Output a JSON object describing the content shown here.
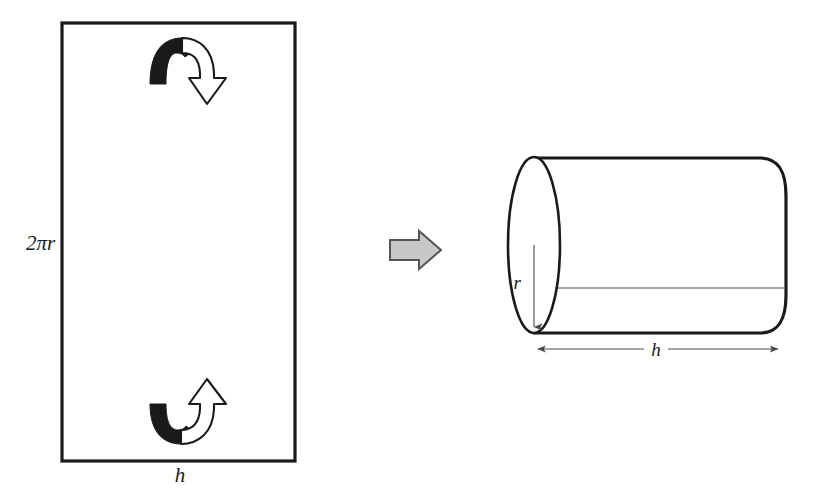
{
  "figure": {
    "background_color": "#ffffff",
    "ink_color": "#1a1a1a",
    "gray_arrow_fill": "#c8c8c8",
    "gray_arrow_stroke": "#555555",
    "thin_line_color": "#4a4a4a"
  },
  "rectangle": {
    "name": "unrolled-lateral-surface",
    "height_label": "2πr",
    "width_label": "h",
    "x": 62,
    "y": 23,
    "width": 233,
    "height": 438
  },
  "roll_arrows": {
    "top": {
      "name": "roll-arrow-top",
      "direction": "down-right",
      "style": "curved-ribbon-with-hollow-head"
    },
    "bottom": {
      "name": "roll-arrow-bottom",
      "direction": "up-right",
      "style": "curved-ribbon-with-hollow-head"
    }
  },
  "transition_arrow": {
    "name": "transformation-arrow",
    "direction": "right",
    "fill": "#c8c8c8",
    "stroke": "#555555"
  },
  "cylinder": {
    "name": "rolled-cylinder",
    "radius_label": "r",
    "length_label": "h",
    "orientation": "horizontal",
    "ellipse_center_x": 534,
    "ellipse_center_y": 245,
    "ellipse_rx": 26,
    "ellipse_ry": 88,
    "body_right_x": 786,
    "top_edge_y": 158,
    "bottom_edge_y": 333,
    "seam_y": 288
  },
  "dimension_lines": {
    "cylinder_length": {
      "name": "h-dimension-arrow",
      "label": "h",
      "x_start": 534,
      "x_end": 780,
      "y": 349,
      "heads": "both"
    },
    "cylinder_radius": {
      "name": "r-dimension-arrow",
      "label": "r",
      "x": 534,
      "y_start": 245,
      "y_end": 331,
      "heads": "end"
    }
  }
}
